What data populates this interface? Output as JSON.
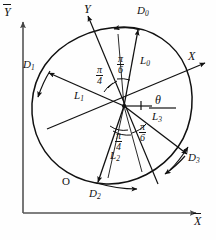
{
  "figure": {
    "type": "geometric-diagram",
    "global_axes": {
      "x_label": "X",
      "y_label": "Y",
      "overbar": true
    },
    "local_axes": {
      "x_label": "X",
      "y_label": "Y"
    },
    "origin_label": "O",
    "rotation_angle_label": "θ",
    "spokes": [
      {
        "name": "L0",
        "label": "L",
        "sub": "0",
        "tip_label": "D",
        "tip_sub": "0"
      },
      {
        "name": "L1",
        "label": "L",
        "sub": "1",
        "tip_label": "D",
        "tip_sub": "1"
      },
      {
        "name": "L2",
        "label": "L",
        "sub": "2",
        "tip_label": "D",
        "tip_sub": "2"
      },
      {
        "name": "L3",
        "label": "L",
        "sub": "3",
        "tip_label": "D",
        "tip_sub": "3"
      }
    ],
    "angles": [
      {
        "id": "upper-left",
        "num": "π",
        "den": "4"
      },
      {
        "id": "upper-right",
        "num": "π",
        "den": "6"
      },
      {
        "id": "lower-left",
        "num": "π",
        "den": "4"
      },
      {
        "id": "lower-right",
        "num": "π",
        "den": "6"
      }
    ],
    "caption": ""
  },
  "colors": {
    "ink": "#111111",
    "axis": "#555555",
    "paper": "#fefefe"
  }
}
